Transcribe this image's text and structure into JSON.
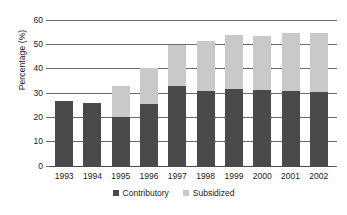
{
  "chart_data": {
    "type": "bar",
    "stacked": true,
    "title": "",
    "subtitle": "",
    "xlabel": "",
    "ylabel": "Percentage (%)",
    "ylim": [
      0,
      60
    ],
    "ytick_step": 10,
    "ytick_labels": [
      "60",
      "50",
      "40",
      "30",
      "20",
      "10",
      "0"
    ],
    "ytick_values": [
      60,
      50,
      40,
      30,
      20,
      10,
      0
    ],
    "grid": true,
    "legend_position": "bottom",
    "categories": [
      "1993",
      "1994",
      "1995",
      "1996",
      "1997",
      "1998",
      "1999",
      "2000",
      "2001",
      "2002"
    ],
    "series": [
      {
        "name": "Contributory",
        "color": "#4a4a4a",
        "values": [
          27,
          26,
          20.5,
          25.5,
          33,
          31,
          32,
          31.5,
          31,
          30.5
        ]
      },
      {
        "name": "Subsidized",
        "color": "#c9c9c9",
        "values": [
          0,
          0,
          12.5,
          15,
          17,
          20.5,
          22,
          22,
          24,
          24.5
        ]
      }
    ],
    "totals": [
      27,
      26,
      33,
      40.5,
      50,
      51.5,
      54,
      53.5,
      55,
      55
    ]
  },
  "legend": {
    "items": [
      {
        "label": "Contributory",
        "swatch": "contributory"
      },
      {
        "label": "Subsidized",
        "swatch": "subsidized"
      }
    ]
  }
}
